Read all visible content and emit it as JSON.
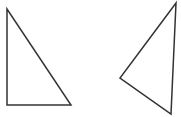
{
  "canvas": {
    "width": 181,
    "height": 117,
    "background": "#ffffff"
  },
  "shapes": [
    {
      "name": "right-triangle",
      "points": "7,9 7,105 71,105",
      "stroke": "#333333",
      "stroke_width": 1.5
    },
    {
      "name": "obtuse-triangle",
      "points": "176,3 120,78 171,114",
      "stroke": "#333333",
      "stroke_width": 1.5
    }
  ]
}
